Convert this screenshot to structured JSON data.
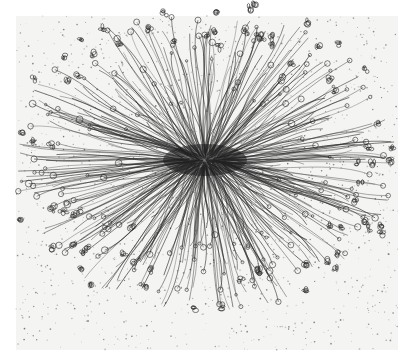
{
  "artwork": {
    "subject": "Radial pen-and-ink drawing of dense wavy tendrils bursting from a dark central core, ending in small curls, loops, and flower-like buds, on speckled paper",
    "canvas": {
      "width": 398,
      "height": 364
    },
    "paper": {
      "x": 16,
      "y": 16,
      "width": 382,
      "height": 334,
      "color": "#f4f4f2"
    },
    "center": {
      "x": 205,
      "y": 160
    },
    "core": {
      "rx": 42,
      "ry": 16,
      "color": "#1a1a1a"
    },
    "radius": {
      "x": 175,
      "y": 140
    },
    "ink_color": "#2a2a2a",
    "speckle_color": "#6b6b6b",
    "strand_count": 380,
    "speckle_count": 1400,
    "bud_count": 70
  }
}
